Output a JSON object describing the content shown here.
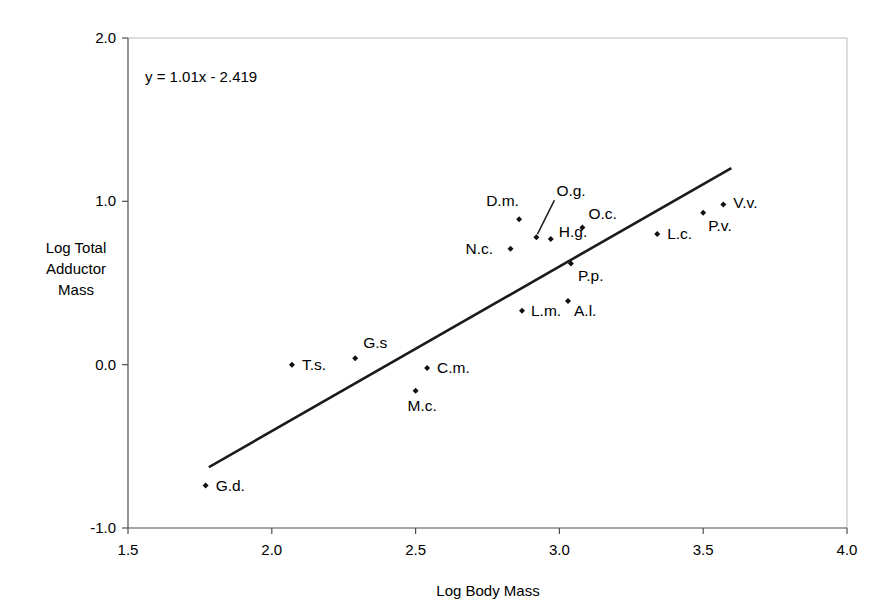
{
  "chart_data": {
    "type": "scatter",
    "title": "",
    "xlabel": "Log Body Mass",
    "ylabel": "Log Total Adductor Mass",
    "ylabel_lines": [
      "Log Total",
      "Adductor",
      "Mass"
    ],
    "xlim": [
      1.5,
      4.0
    ],
    "ylim": [
      -1.0,
      2.0
    ],
    "xticks": [
      1.5,
      2.0,
      2.5,
      3.0,
      3.5,
      4.0
    ],
    "xtick_labels": [
      "1.5",
      "2.0",
      "2.5",
      "3.0",
      "3.5",
      "4.0"
    ],
    "yticks": [
      -1.0,
      0.0,
      1.0,
      2.0
    ],
    "ytick_labels": [
      "-1.0",
      "0.0",
      "1.0",
      "2.0"
    ],
    "grid": false,
    "legend": "none",
    "annotation": "y = 1.01x - 2.419",
    "equation": {
      "slope": 1.01,
      "intercept": -2.419,
      "text": "y = 1.01x - 2.419"
    },
    "trendline": {
      "x_start": 1.785,
      "y_start": -0.624,
      "x_end": 3.594,
      "y_end": 1.2
    },
    "points": [
      {
        "label": "G.d.",
        "x": 1.77,
        "y": -0.74,
        "label_dx": 10,
        "label_dy": 5
      },
      {
        "label": "T.s.",
        "x": 2.07,
        "y": 0.0,
        "label_dx": 10,
        "label_dy": 5
      },
      {
        "label": "G.s",
        "x": 2.29,
        "y": 0.04,
        "label_dx": 8,
        "label_dy": -10
      },
      {
        "label": "M.c.",
        "x": 2.5,
        "y": -0.16,
        "label_dx": -8,
        "label_dy": 20
      },
      {
        "label": "C.m.",
        "x": 2.54,
        "y": -0.02,
        "label_dx": 10,
        "label_dy": 5
      },
      {
        "label": "L.m.",
        "x": 2.87,
        "y": 0.33,
        "label_dx": 9,
        "label_dy": 5
      },
      {
        "label": "A.l.",
        "x": 3.03,
        "y": 0.39,
        "label_dx": 6,
        "label_dy": 15
      },
      {
        "label": "D.m.",
        "x": 2.86,
        "y": 0.89,
        "label_dx": -33,
        "label_dy": -13
      },
      {
        "label": "N.c.",
        "x": 2.83,
        "y": 0.71,
        "label_dx": -45,
        "label_dy": 5
      },
      {
        "label": "O.g.",
        "x": 2.92,
        "y": 0.78,
        "label_dx": 20,
        "label_dy": -41,
        "leader": true
      },
      {
        "label": "H.g.",
        "x": 2.97,
        "y": 0.77,
        "label_dx": 8,
        "label_dy": -2
      },
      {
        "label": "O.c.",
        "x": 3.08,
        "y": 0.84,
        "label_dx": 6,
        "label_dy": -8
      },
      {
        "label": "P.p.",
        "x": 3.04,
        "y": 0.62,
        "label_dx": 7,
        "label_dy": 18
      },
      {
        "label": "L.c.",
        "x": 3.34,
        "y": 0.8,
        "label_dx": 10,
        "label_dy": 5
      },
      {
        "label": "P.v.",
        "x": 3.5,
        "y": 0.93,
        "label_dx": 5,
        "label_dy": 18
      },
      {
        "label": "V.v.",
        "x": 3.57,
        "y": 0.98,
        "label_dx": 10,
        "label_dy": 3
      }
    ]
  },
  "colors": {
    "marker": "#111111",
    "trendline": "#1a1a1a",
    "axis": "#4d4d4d",
    "frame": "#b9b9b9",
    "background": "#ffffff",
    "text": "#000000"
  }
}
